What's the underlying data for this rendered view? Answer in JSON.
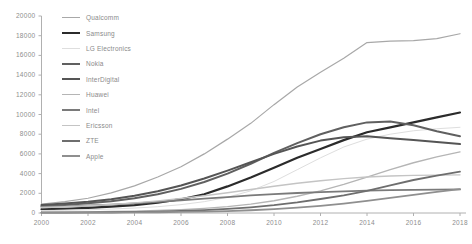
{
  "chart_data": {
    "type": "line",
    "title": "",
    "xlabel": "",
    "ylabel": "",
    "xlim": [
      2000,
      2018
    ],
    "ylim": [
      0,
      20000
    ],
    "grid": false,
    "legend_position": "top-left-inside",
    "x": [
      2000,
      2001,
      2002,
      2003,
      2004,
      2005,
      2006,
      2007,
      2008,
      2009,
      2010,
      2011,
      2012,
      2013,
      2014,
      2015,
      2016,
      2017,
      2018
    ],
    "xtick_labels": [
      "2000",
      "2002",
      "2004",
      "2006",
      "2008",
      "2010",
      "2012",
      "2014",
      "2016",
      "2018"
    ],
    "xticks": [
      2000,
      2002,
      2004,
      2006,
      2008,
      2010,
      2012,
      2014,
      2016,
      2018
    ],
    "ytick_labels": [
      "0",
      "2000",
      "4000",
      "6000",
      "8000",
      "10000",
      "12000",
      "14000",
      "16000",
      "18000",
      "20000"
    ],
    "yticks": [
      0,
      2000,
      4000,
      6000,
      8000,
      10000,
      12000,
      14000,
      16000,
      18000,
      20000
    ],
    "series": [
      {
        "name": "Qualcomm",
        "color": "#a8a8a8",
        "width": 1.2,
        "values": [
          900,
          1150,
          1500,
          2050,
          2750,
          3650,
          4700,
          6000,
          7500,
          9100,
          11000,
          12800,
          14300,
          15700,
          17300,
          17450,
          17500,
          17700,
          18200
        ]
      },
      {
        "name": "Samsung",
        "color": "#2b2b2b",
        "width": 2.2,
        "values": [
          380,
          430,
          520,
          640,
          800,
          1050,
          1400,
          1900,
          2700,
          3600,
          4600,
          5600,
          6500,
          7400,
          8200,
          8700,
          9200,
          9700,
          10200
        ]
      },
      {
        "name": "LG Electronics",
        "color": "#dedede",
        "width": 1.0,
        "values": [
          250,
          280,
          330,
          400,
          500,
          640,
          850,
          1150,
          1600,
          2250,
          3200,
          4400,
          5600,
          6700,
          7500,
          8000,
          8350,
          8550,
          8700
        ]
      },
      {
        "name": "Nokia",
        "color": "#606060",
        "width": 2.0,
        "values": [
          700,
          820,
          980,
          1200,
          1500,
          1900,
          2450,
          3150,
          4000,
          5000,
          6100,
          7100,
          8000,
          8700,
          9200,
          9300,
          8900,
          8300,
          7800
        ]
      },
      {
        "name": "InterDigital",
        "color": "#555555",
        "width": 2.0,
        "values": [
          820,
          960,
          1150,
          1400,
          1750,
          2200,
          2800,
          3500,
          4300,
          5150,
          6000,
          6750,
          7350,
          7700,
          7800,
          7600,
          7400,
          7200,
          7000
        ]
      },
      {
        "name": "Huawei",
        "color": "#b5b5b5",
        "width": 1.4,
        "values": [
          80,
          95,
          115,
          145,
          190,
          250,
          340,
          470,
          650,
          900,
          1250,
          1700,
          2250,
          2900,
          3650,
          4400,
          5100,
          5700,
          6200
        ]
      },
      {
        "name": "Intel",
        "color": "#7a7a7a",
        "width": 1.8,
        "values": [
          620,
          680,
          760,
          860,
          980,
          1120,
          1280,
          1450,
          1620,
          1780,
          1920,
          2030,
          2120,
          2200,
          2270,
          2320,
          2350,
          2370,
          2390
        ]
      },
      {
        "name": "Ericsson",
        "color": "#c4c4c4",
        "width": 1.4,
        "values": [
          560,
          640,
          740,
          870,
          1030,
          1230,
          1470,
          1750,
          2060,
          2390,
          2720,
          3020,
          3280,
          3490,
          3650,
          3760,
          3820,
          3850,
          3870
        ]
      },
      {
        "name": "ZTE",
        "color": "#6e6e6e",
        "width": 1.8,
        "values": [
          40,
          48,
          60,
          78,
          105,
          145,
          205,
          290,
          410,
          580,
          800,
          1080,
          1420,
          1800,
          2250,
          2800,
          3350,
          3800,
          4200
        ]
      },
      {
        "name": "Apple",
        "color": "#8f8f8f",
        "width": 1.8,
        "values": [
          30,
          34,
          40,
          48,
          60,
          78,
          105,
          145,
          200,
          280,
          390,
          540,
          730,
          960,
          1230,
          1530,
          1850,
          2150,
          2420
        ]
      }
    ]
  },
  "axis": {
    "y_labels": [
      "20000",
      "18000",
      "16000",
      "14000",
      "12000",
      "10000",
      "8000",
      "6000",
      "4000",
      "2000",
      "0"
    ],
    "x_labels": [
      "2000",
      "2002",
      "2004",
      "2006",
      "2008",
      "2010",
      "2012",
      "2014",
      "2016",
      "2018"
    ]
  },
  "legend": {
    "items": [
      {
        "label": "Qualcomm"
      },
      {
        "label": "Samsung"
      },
      {
        "label": "LG Electronics"
      },
      {
        "label": "Nokia"
      },
      {
        "label": "InterDigital"
      },
      {
        "label": "Huawei"
      },
      {
        "label": "Intel"
      },
      {
        "label": "Ericsson"
      },
      {
        "label": "ZTE"
      },
      {
        "label": "Apple"
      }
    ]
  },
  "footnote": {
    "text": ""
  },
  "colors": {
    "axis": "#b0b0b0",
    "tick_text": "#8d8d8d",
    "background": "#ffffff"
  }
}
